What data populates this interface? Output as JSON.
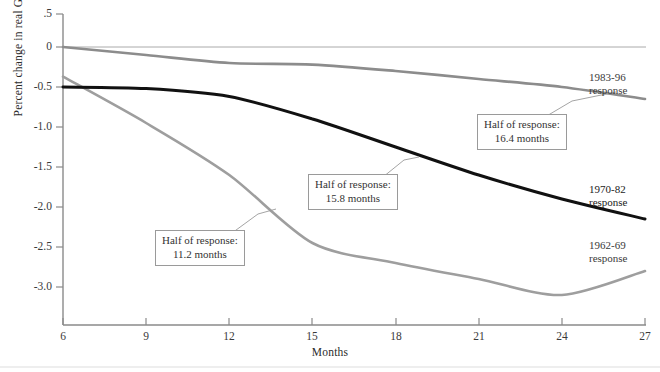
{
  "chart_data": {
    "type": "line",
    "title": "",
    "xlabel": "Months",
    "ylabel": "Percent change in real GDP",
    "x": [
      6,
      9,
      12,
      15,
      18,
      21,
      24,
      27
    ],
    "xlim": [
      6,
      27
    ],
    "ylim": [
      -3.25,
      0.5
    ],
    "grid": false,
    "legend_position": "right-inline",
    "yticks": [
      0.5,
      0,
      -0.5,
      -1.0,
      -1.5,
      -2.0,
      -2.5,
      -3.0
    ],
    "ytick_labels": [
      ".5",
      "0",
      "-0.5",
      "-1.0",
      "-1.5",
      "-2.0",
      "-2.5",
      "-3.0"
    ],
    "xtick_labels": [
      "6",
      "9",
      "12",
      "15",
      "18",
      "21",
      "24",
      "27"
    ],
    "series": [
      {
        "name": "1983-96 response",
        "color": "#8c8c8c",
        "width": 2.6,
        "values": [
          0.0,
          -0.1,
          -0.2,
          -0.22,
          -0.3,
          -0.4,
          -0.5,
          -0.65
        ]
      },
      {
        "name": "1970-82 response",
        "color": "#111111",
        "width": 3.0,
        "values": [
          -0.5,
          -0.52,
          -0.62,
          -0.9,
          -1.25,
          -1.6,
          -1.9,
          -2.15
        ]
      },
      {
        "name": "1962-69 response",
        "color": "#9e9e9e",
        "width": 2.6,
        "values": [
          -0.37,
          -0.95,
          -1.6,
          -2.45,
          -2.7,
          -2.9,
          -3.1,
          -2.8
        ]
      }
    ],
    "annotations": [
      {
        "id": "callout-1983",
        "line1": "Half of response:",
        "line2": "16.4 months",
        "value_months": 16.4,
        "series": "1983-96 response"
      },
      {
        "id": "callout-1970",
        "line1": "Half of response:",
        "line2": "15.8  months",
        "value_months": 15.8,
        "series": "1970-82 response"
      },
      {
        "id": "callout-1962",
        "line1": "Half of response:",
        "line2": "11.2 months",
        "value_months": 11.2,
        "series": "1962-69 response"
      }
    ],
    "series_labels": [
      {
        "line1": "1983-96",
        "line2": "response"
      },
      {
        "line1": "1970-82",
        "line2": "response"
      },
      {
        "line1": "1962-69",
        "line2": "response"
      }
    ]
  },
  "axis": {
    "y_title": "Percent change in real GDP",
    "x_title": "Months"
  }
}
